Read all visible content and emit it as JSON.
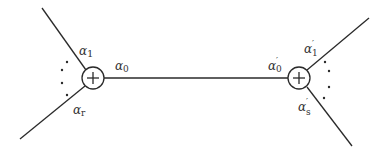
{
  "diagram": {
    "colors": {
      "stroke": "#2a2a2a",
      "background": "#ffffff",
      "text": "#333333"
    },
    "nodes": [
      {
        "id": "left-junction",
        "symbol": "+",
        "shape": "circled-plus"
      },
      {
        "id": "right-junction",
        "symbol": "+",
        "shape": "circled-plus"
      }
    ],
    "labels": {
      "left_top": {
        "base": "α",
        "sub": "1",
        "prime": ""
      },
      "left_bottom": {
        "base": "α",
        "sub": "r",
        "prime": ""
      },
      "center_left": {
        "base": "α",
        "sub": "0",
        "prime": ""
      },
      "center_right": {
        "base": "α",
        "sub": "0",
        "prime": "′"
      },
      "right_top": {
        "base": "α",
        "sub": "1",
        "prime": "′"
      },
      "right_bottom": {
        "base": "α",
        "sub": "s",
        "prime": "′"
      }
    },
    "ellipsis_dots": "⋮"
  }
}
